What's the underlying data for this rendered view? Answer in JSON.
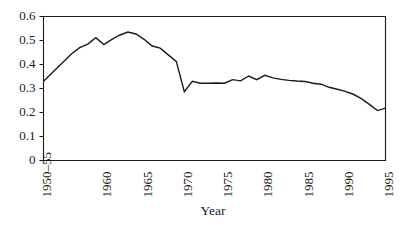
{
  "chart_data": {
    "type": "line",
    "title": "",
    "xlabel": "Year",
    "ylabel": "",
    "ylim": [
      0,
      0.6
    ],
    "xlim": [
      1952.5,
      1995
    ],
    "grid": false,
    "legend": null,
    "ytick_labels": [
      "0.6",
      "0.5",
      "0.4",
      "0.3",
      "0.2",
      "0.1",
      "0"
    ],
    "ytick_values": [
      0.6,
      0.5,
      0.4,
      0.3,
      0.2,
      0.1,
      0
    ],
    "xtick_labels": [
      "1950–55",
      "1960",
      "1965",
      "1970",
      "1975",
      "1980",
      "1985",
      "1990",
      "1995"
    ],
    "xtick_values": [
      1952.5,
      1960,
      1965,
      1970,
      1975,
      1980,
      1985,
      1990,
      1995
    ],
    "line_color": "#1a1a1a",
    "series": [
      {
        "name": "series-1",
        "x": [
          1952.5,
          1956,
          1957,
          1958,
          1959,
          1960,
          1961,
          1962,
          1963,
          1964,
          1965,
          1966,
          1967,
          1968,
          1969,
          1970,
          1971,
          1972,
          1973,
          1974,
          1975,
          1976,
          1977,
          1978,
          1979,
          1980,
          1981,
          1982,
          1983,
          1984,
          1985,
          1986,
          1987,
          1988,
          1989,
          1990,
          1991,
          1992,
          1993,
          1994,
          1995
        ],
        "values": [
          0.33,
          0.445,
          0.47,
          0.485,
          0.512,
          0.483,
          0.505,
          0.523,
          0.535,
          0.527,
          0.505,
          0.477,
          0.468,
          0.44,
          0.413,
          0.287,
          0.33,
          0.322,
          0.322,
          0.323,
          0.322,
          0.337,
          0.332,
          0.352,
          0.337,
          0.355,
          0.344,
          0.338,
          0.334,
          0.331,
          0.329,
          0.322,
          0.318,
          0.305,
          0.297,
          0.288,
          0.276,
          0.258,
          0.234,
          0.208,
          0.218
        ]
      }
    ]
  }
}
